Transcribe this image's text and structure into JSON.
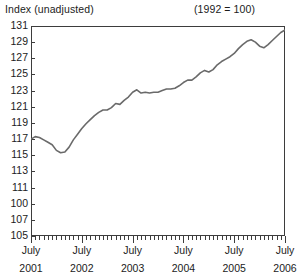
{
  "header": {
    "left_title": "Index (unadjusted)",
    "right_title": "(1992 = 100)"
  },
  "chart_data": {
    "type": "line",
    "title": "Index (unadjusted)",
    "subtitle": "(1992 = 100)",
    "xlabel": "",
    "ylabel": "Index (unadjusted)",
    "base_note": "(1992 = 100)",
    "grid": false,
    "legend": "none",
    "line_color": "#6a6a6a",
    "frame_color": "#3d3d3d",
    "ylim": [
      105,
      131
    ],
    "ytick_labels": [
      "131",
      "129",
      "127",
      "125",
      "123",
      "121",
      "119",
      "117",
      "115",
      "113",
      "111",
      "100",
      "107",
      "105"
    ],
    "ytick_values": [
      131,
      129,
      127,
      125,
      123,
      121,
      119,
      117,
      115,
      113,
      111,
      109,
      107,
      105
    ],
    "xlim": [
      "2001-07",
      "2006-07"
    ],
    "xtick_labels": [
      {
        "month": "July",
        "year": "2001"
      },
      {
        "month": "July",
        "year": "2002"
      },
      {
        "month": "July",
        "year": "2003"
      },
      {
        "month": "July",
        "year": "2004"
      },
      {
        "month": "July",
        "year": "2005"
      },
      {
        "month": "July",
        "year": "2006"
      }
    ],
    "minor_tick_interval": "1 month",
    "x": [
      "2001-07",
      "2001-08",
      "2001-09",
      "2001-10",
      "2001-11",
      "2001-12",
      "2002-01",
      "2002-02",
      "2002-03",
      "2002-04",
      "2002-05",
      "2002-06",
      "2002-07",
      "2002-08",
      "2002-09",
      "2002-10",
      "2002-11",
      "2002-12",
      "2003-01",
      "2003-02",
      "2003-03",
      "2003-04",
      "2003-05",
      "2003-06",
      "2003-07",
      "2003-08",
      "2003-09",
      "2003-10",
      "2003-11",
      "2003-12",
      "2004-01",
      "2004-02",
      "2004-03",
      "2004-04",
      "2004-05",
      "2004-06",
      "2004-07",
      "2004-08",
      "2004-09",
      "2004-10",
      "2004-11",
      "2004-12",
      "2005-01",
      "2005-02",
      "2005-03",
      "2005-04",
      "2005-05",
      "2005-06",
      "2005-07",
      "2005-08",
      "2005-09",
      "2005-10",
      "2005-11",
      "2005-12",
      "2006-01",
      "2006-02",
      "2006-03",
      "2006-04",
      "2006-05",
      "2006-06",
      "2006-07"
    ],
    "values": [
      117.0,
      117.3,
      117.2,
      116.9,
      116.6,
      116.3,
      115.6,
      115.3,
      115.4,
      116.0,
      116.9,
      117.6,
      118.3,
      118.9,
      119.4,
      119.9,
      120.3,
      120.6,
      120.6,
      120.9,
      121.4,
      121.3,
      121.8,
      122.2,
      122.8,
      123.1,
      122.7,
      122.8,
      122.7,
      122.8,
      122.8,
      123.0,
      123.2,
      123.2,
      123.3,
      123.6,
      124.0,
      124.3,
      124.3,
      124.7,
      125.2,
      125.5,
      125.3,
      125.6,
      126.2,
      126.6,
      126.9,
      127.2,
      127.6,
      128.2,
      128.7,
      129.1,
      129.3,
      129.0,
      128.5,
      128.3,
      128.7,
      129.2,
      129.7,
      130.2,
      130.5
    ]
  }
}
